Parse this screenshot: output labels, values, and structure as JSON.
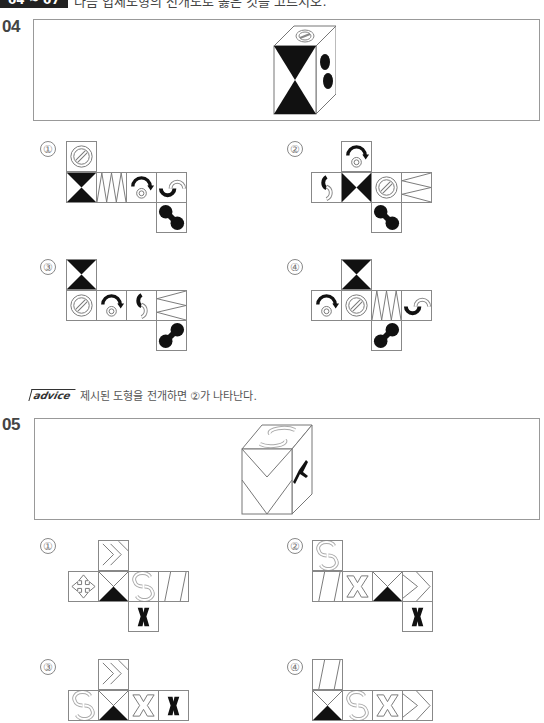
{
  "header": {
    "range_badge": "04 ~ 07",
    "instruction": "다음 입체도형의 전개도로 옳은 것을 고르시오."
  },
  "questions": [
    {
      "number": "04",
      "cube_faces": {
        "front": "hourglass",
        "top": "slashed-circle",
        "right": "dumbbell"
      },
      "options": [
        {
          "label": "①",
          "layout": "cells: top[slashed-circle], row[hourglass, zigzag, arrow-circle, hook], bottom[dumbbell]"
        },
        {
          "label": "②",
          "layout": "cells: top[arrow-circle], row[hook, bowtie, slashed-circle, zigzag], bottom[dumbbell]"
        },
        {
          "label": "③",
          "layout": "cells: top[hourglass], row[slashed-circle, arrow-circle, hook, zigzag], bottom[dumbbell]"
        },
        {
          "label": "④",
          "layout": "cells: top[hourglass], row[arrow-circle, slashed-circle, zigzag, hook], bottom[dumbbell]"
        }
      ],
      "advice_tag": "advice",
      "advice_text": "제시된 도형을 전개하면 ②가 나타난다."
    },
    {
      "number": "05",
      "cube_faces": {
        "front": "double-chevron",
        "top": "swirl-arrows",
        "right": "x-mark"
      },
      "options": [
        {
          "label": "①",
          "layout": "cells: top[chevrons], row[cross-arrows, chevron-triangle, swirl-arrows, slant-lines], bottom[x-mark]"
        },
        {
          "label": "②",
          "layout": "cells: top[swirl-arrows], row[slant-lines, cross-arrows, chevron-triangle, chevrons], bottom[x-mark]"
        },
        {
          "label": "③",
          "layout": "cells: top[chevrons], row[swirl-arrows, chevron-triangle, cross-arrows, x-mark]"
        },
        {
          "label": "④",
          "layout": "cells: top[slant-lines], row[chevron-triangle, swirl-arrows, cross-arrows, chevrons]"
        }
      ]
    }
  ]
}
